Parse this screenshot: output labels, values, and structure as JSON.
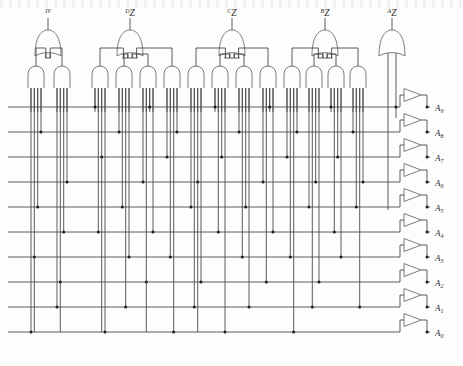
{
  "figure": {
    "title_fragment": "",
    "width": 463,
    "height": 366,
    "background": "#fdfdfd",
    "line_color": "#4a4a4a",
    "text_color": "#2b2b2b"
  },
  "gate_groups": [
    {
      "id": "g1",
      "label_sup": "IV",
      "label_main": "",
      "or_x": 48,
      "and_count": 2
    },
    {
      "id": "g2",
      "label_sup": "D",
      "label_main": "Z",
      "or_x": 130,
      "and_count": 4
    },
    {
      "id": "g3",
      "label_sup": "C",
      "label_main": "Z",
      "or_x": 232,
      "and_count": 4
    },
    {
      "id": "g4",
      "label_sup": "B",
      "label_main": "Z",
      "or_x": 325,
      "and_count": 4
    },
    {
      "id": "g5",
      "label_sup": "A",
      "label_main": "Z",
      "or_x": 392,
      "and_count": 0
    }
  ],
  "outputs": [
    {
      "index": 0,
      "label_main": "A",
      "label_sub": "9",
      "y": 107
    },
    {
      "index": 1,
      "label_main": "A",
      "label_sub": "8",
      "y": 132
    },
    {
      "index": 2,
      "label_main": "A",
      "label_sub": "7",
      "y": 157
    },
    {
      "index": 3,
      "label_main": "A",
      "label_sub": "6",
      "y": 182
    },
    {
      "index": 4,
      "label_main": "A",
      "label_sub": "5",
      "y": 207
    },
    {
      "index": 5,
      "label_main": "A",
      "label_sub": "4",
      "y": 232
    },
    {
      "index": 6,
      "label_main": "A",
      "label_sub": "3",
      "y": 257
    },
    {
      "index": 7,
      "label_main": "A",
      "label_sub": "2",
      "y": 282
    },
    {
      "index": 8,
      "label_main": "A",
      "label_sub": "1",
      "y": 307
    },
    {
      "index": 9,
      "label_main": "A",
      "label_sub": "0",
      "y": 332
    }
  ],
  "bus": {
    "left_x": 8,
    "right_x": 400,
    "rows": 10,
    "first_y": 107,
    "spacing": 25
  },
  "colors": {
    "wire": "#4a4a4a",
    "gate_stroke": "#6d6d6d",
    "dot": "#1f1f1f",
    "page": "#fdfdfd"
  }
}
